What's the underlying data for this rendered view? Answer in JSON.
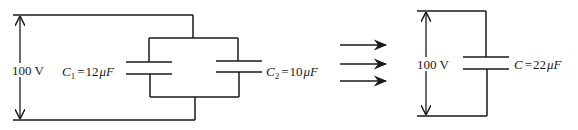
{
  "diagram": {
    "left_circuit": {
      "voltage_label": "100 V",
      "capacitors": [
        {
          "symbol": "C",
          "subscript": "1",
          "equals": "=",
          "value": "12",
          "unit": "μF"
        },
        {
          "symbol": "C",
          "subscript": "2",
          "equals": "=",
          "value": "10",
          "unit": "μF"
        }
      ]
    },
    "transition": {
      "arrow_count": 3,
      "meaning": "equivalent to"
    },
    "right_circuit": {
      "voltage_label": "100 V",
      "capacitor": {
        "symbol": "C",
        "equals": "=",
        "value": "22",
        "unit": "μF"
      }
    },
    "colors": {
      "line": "#1a1a1a",
      "background": "#ffffff"
    }
  }
}
